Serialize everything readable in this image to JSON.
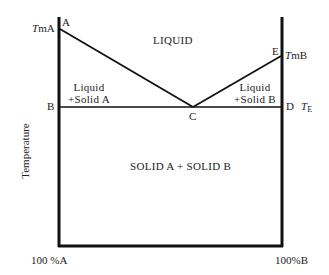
{
  "diagram": {
    "type": "binary eutectic phase diagram",
    "y_axis_label": "Temperature",
    "x_axis": {
      "left_label": "100 %A",
      "right_label": "100%B"
    },
    "points": {
      "A": {
        "label": "A",
        "temp_label_prefix": "T",
        "temp_label_suffix": "mA"
      },
      "B": {
        "label": "B"
      },
      "C": {
        "label": "C"
      },
      "D": {
        "label": "D",
        "temp_label": "T",
        "temp_sub": "E"
      },
      "E": {
        "label": "E",
        "temp_label_prefix": "T",
        "temp_label_suffix": "mB"
      }
    },
    "regions": {
      "liquid": "LIQUID",
      "liquid_solid_a": {
        "line1": "Liquid",
        "line2": "+Solid A"
      },
      "liquid_solid_b": {
        "line1": "Liquid",
        "line2": "+Solid B"
      },
      "solid": "SOLID A + SOLID B"
    },
    "colors": {
      "line": "#111111",
      "background": "#ffffff"
    }
  }
}
